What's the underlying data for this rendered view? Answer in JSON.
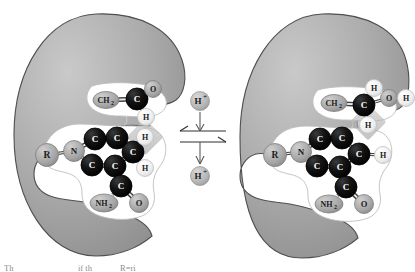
{
  "figure": {
    "background_color": "#ffffff",
    "enzyme_fill": "#a8a8a8",
    "enzyme_stroke": "#4d4d4d",
    "pocket_fill": "#ffffff",
    "pocket_stroke": "#b3b3b3",
    "carbon_color": "#0d0d0d",
    "heteroatom_color": "#a8a8a8",
    "hydrogen_color": "#f2f2f2",
    "highlight_color": "#b5b5b5",
    "bond_color": "#3d3d3d"
  },
  "center": {
    "top_label": "H",
    "top_charge": "+",
    "bottom_label": "H",
    "bottom_charge": "+",
    "top_full": "H+",
    "bottom_full": "H+",
    "equilibrium_symbol": "reversible-reaction-arrows"
  },
  "left_panel": {
    "name": "deprotonated-state",
    "atoms": [
      {
        "id": "L-R",
        "label": "R",
        "kind": "group",
        "x": 47,
        "y": 155,
        "r": 11.5,
        "fsize": 9.5
      },
      {
        "id": "L-N",
        "label": "N",
        "kind": "heteroatom",
        "x": 74,
        "y": 151,
        "r": 10.5,
        "fsize": 9
      },
      {
        "id": "L-C1",
        "label": "C",
        "kind": "carbon",
        "x": 95,
        "y": 139,
        "r": 11,
        "fsize": 9
      },
      {
        "id": "L-C2",
        "label": "C",
        "kind": "carbon",
        "x": 117,
        "y": 138,
        "r": 11,
        "fsize": 9
      },
      {
        "id": "L-C3",
        "label": "C",
        "kind": "carbon",
        "x": 133,
        "y": 152,
        "r": 11,
        "fsize": 9
      },
      {
        "id": "L-C4",
        "label": "C",
        "kind": "carbon",
        "x": 115,
        "y": 166,
        "r": 11,
        "fsize": 9
      },
      {
        "id": "L-C5",
        "label": "C",
        "kind": "carbon",
        "x": 92,
        "y": 165,
        "r": 11,
        "fsize": 9
      },
      {
        "id": "L-C6",
        "label": "C",
        "kind": "carbon",
        "x": 121,
        "y": 186,
        "r": 11,
        "fsize": 9
      },
      {
        "id": "L-NH2",
        "label": "NH",
        "sub": "2",
        "kind": "heteroatom",
        "x": 104,
        "y": 203,
        "rx": 14,
        "ry": 9,
        "fsize": 8
      },
      {
        "id": "L-O1",
        "label": "O",
        "kind": "heteroatom",
        "x": 139,
        "y": 203,
        "r": 9.5,
        "fsize": 8.5
      },
      {
        "id": "L-H1",
        "label": "H",
        "kind": "hydrogen",
        "x": 145,
        "y": 137,
        "r": 8.5,
        "fsize": 8
      },
      {
        "id": "L-H2",
        "label": "H",
        "kind": "hydrogen",
        "x": 145,
        "y": 168,
        "r": 8.5,
        "fsize": 8
      },
      {
        "id": "L-CH2",
        "label": "CH",
        "sub": "2",
        "kind": "heteroatom",
        "x": 106,
        "y": 100,
        "rx": 13,
        "ry": 8.5,
        "fsize": 8
      },
      {
        "id": "L-C7",
        "label": "C",
        "kind": "carbon",
        "x": 137,
        "y": 99,
        "r": 11,
        "fsize": 9
      },
      {
        "id": "L-O2",
        "label": "O",
        "kind": "heteroatom",
        "x": 153,
        "y": 89,
        "r": 8.5,
        "fsize": 8
      },
      {
        "id": "L-H3",
        "label": "H",
        "kind": "hydrogen",
        "x": 146,
        "y": 117,
        "r": 8.5,
        "fsize": 8
      }
    ],
    "bonds": [
      {
        "from": "L-R",
        "to": "L-N",
        "order": 1
      },
      {
        "from": "L-N",
        "to": "L-C1",
        "order": 2
      },
      {
        "from": "L-N",
        "to": "L-C5",
        "order": 1
      },
      {
        "from": "L-C1",
        "to": "L-C2",
        "order": 2
      },
      {
        "from": "L-C2",
        "to": "L-C3",
        "order": 1
      },
      {
        "from": "L-C3",
        "to": "L-C4",
        "order": 2
      },
      {
        "from": "L-C4",
        "to": "L-C5",
        "order": 2
      },
      {
        "from": "L-C4",
        "to": "L-C6",
        "order": 1
      },
      {
        "from": "L-C6",
        "to": "L-NH2",
        "order": 1
      },
      {
        "from": "L-C6",
        "to": "L-O1",
        "order": 2
      },
      {
        "from": "L-C3",
        "to": "L-H1",
        "order": 1
      },
      {
        "from": "L-C3",
        "to": "L-H2",
        "order": 1
      },
      {
        "from": "L-CH2",
        "to": "L-C7",
        "order": 2
      },
      {
        "from": "L-C7",
        "to": "L-O2",
        "order": 2
      },
      {
        "from": "L-C7",
        "to": "L-H3",
        "order": 1
      }
    ],
    "highlight": {
      "x": 145,
      "y": 137,
      "size": 17,
      "rotation": 45
    }
  },
  "right_panel": {
    "name": "protonated-state",
    "atoms": [
      {
        "id": "R-R",
        "label": "R",
        "kind": "group",
        "x": 275,
        "y": 155,
        "r": 11.5,
        "fsize": 9.5
      },
      {
        "id": "R-N",
        "label": "N",
        "kind": "heteroatom",
        "x": 301,
        "y": 152,
        "r": 10.5,
        "fsize": 9
      },
      {
        "id": "R-C1",
        "label": "C",
        "kind": "carbon",
        "x": 320,
        "y": 139,
        "r": 11,
        "fsize": 9
      },
      {
        "id": "R-C2",
        "label": "C",
        "kind": "carbon",
        "x": 342,
        "y": 138,
        "r": 11,
        "fsize": 9
      },
      {
        "id": "R-C3",
        "label": "C",
        "kind": "carbon",
        "x": 359,
        "y": 154,
        "r": 11,
        "fsize": 9
      },
      {
        "id": "R-C4",
        "label": "C",
        "kind": "carbon",
        "x": 340,
        "y": 167,
        "r": 11,
        "fsize": 9
      },
      {
        "id": "R-C5",
        "label": "C",
        "kind": "carbon",
        "x": 317,
        "y": 166,
        "r": 11,
        "fsize": 9
      },
      {
        "id": "R-C6",
        "label": "C",
        "kind": "carbon",
        "x": 346,
        "y": 187,
        "r": 11,
        "fsize": 9
      },
      {
        "id": "R-NH2",
        "label": "NH",
        "sub": "2",
        "kind": "heteroatom",
        "x": 329,
        "y": 204,
        "rx": 14,
        "ry": 9,
        "fsize": 8
      },
      {
        "id": "R-O1",
        "label": "O",
        "kind": "heteroatom",
        "x": 364,
        "y": 204,
        "r": 9.5,
        "fsize": 8.5
      },
      {
        "id": "R-H1",
        "label": "H",
        "kind": "hydrogen",
        "x": 383,
        "y": 155,
        "r": 8.5,
        "fsize": 8
      },
      {
        "id": "R-CH2",
        "label": "CH",
        "sub": "2",
        "kind": "heteroatom",
        "x": 334,
        "y": 103,
        "rx": 13,
        "ry": 8.5,
        "fsize": 8
      },
      {
        "id": "R-C7",
        "label": "C",
        "kind": "carbon",
        "x": 364,
        "y": 105,
        "r": 11,
        "fsize": 9
      },
      {
        "id": "R-H2",
        "label": "H",
        "kind": "hydrogen",
        "x": 374,
        "y": 88,
        "r": 8.5,
        "fsize": 8
      },
      {
        "id": "R-O2",
        "label": "O",
        "kind": "heteroatom",
        "x": 389,
        "y": 98,
        "r": 8.5,
        "fsize": 8
      },
      {
        "id": "R-H3",
        "label": "H",
        "kind": "hydrogen",
        "x": 406,
        "y": 98,
        "r": 8.5,
        "fsize": 8
      },
      {
        "id": "R-H4",
        "label": "H",
        "kind": "hydrogen",
        "x": 368,
        "y": 125,
        "r": 8.5,
        "fsize": 8
      }
    ],
    "bonds": [
      {
        "from": "R-R",
        "to": "R-N",
        "order": 1
      },
      {
        "from": "R-N",
        "to": "R-C1",
        "order": 2
      },
      {
        "from": "R-N",
        "to": "R-C5",
        "order": 1
      },
      {
        "from": "R-C1",
        "to": "R-C2",
        "order": 2
      },
      {
        "from": "R-C2",
        "to": "R-C3",
        "order": 1
      },
      {
        "from": "R-C3",
        "to": "R-C4",
        "order": 2
      },
      {
        "from": "R-C4",
        "to": "R-C5",
        "order": 2
      },
      {
        "from": "R-C4",
        "to": "R-C6",
        "order": 1
      },
      {
        "from": "R-C6",
        "to": "R-NH2",
        "order": 1
      },
      {
        "from": "R-C6",
        "to": "R-O1",
        "order": 2
      },
      {
        "from": "R-C3",
        "to": "R-H1",
        "order": 1
      },
      {
        "from": "R-CH2",
        "to": "R-C7",
        "order": 2
      },
      {
        "from": "R-C7",
        "to": "R-H2",
        "order": 1
      },
      {
        "from": "R-C7",
        "to": "R-O2",
        "order": 1
      },
      {
        "from": "R-O2",
        "to": "R-H3",
        "order": 1
      },
      {
        "from": "R-C7",
        "to": "R-H4",
        "order": 1
      }
    ],
    "highlight": {
      "x": 368,
      "y": 122,
      "size": 17,
      "rotation": 45
    }
  },
  "caption": {
    "text": "Th",
    "text2": "if th",
    "text3": "R=ri",
    "truncated": true
  }
}
